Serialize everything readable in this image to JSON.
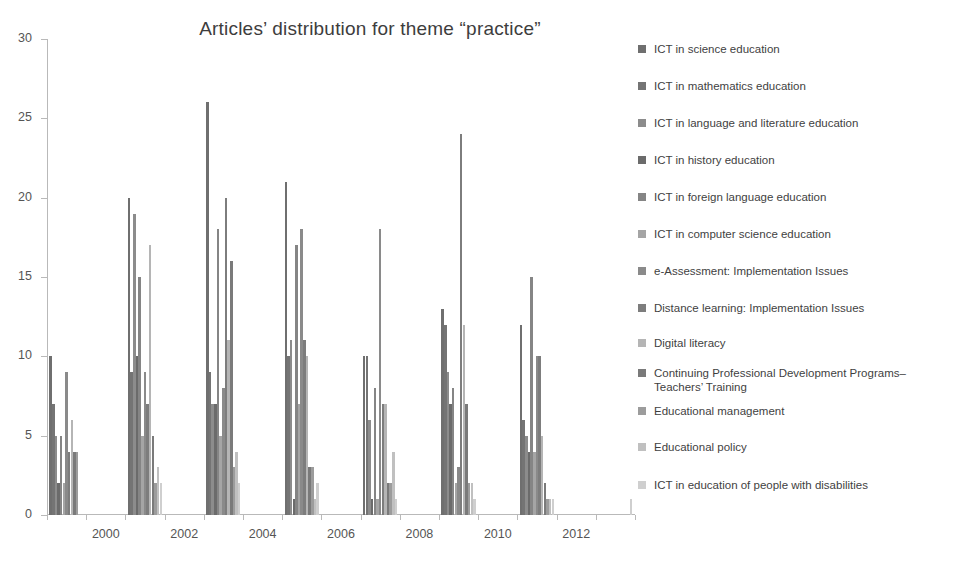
{
  "chart_data": {
    "type": "bar",
    "title": "Articles’ distribution for theme “practice”",
    "xlabel": "",
    "ylabel": "",
    "ylim": [
      0,
      30
    ],
    "ytick_values": [
      0,
      5,
      10,
      15,
      20,
      25,
      30
    ],
    "ytick_labels": [
      "0",
      "5",
      "10",
      "15",
      "20",
      "25",
      "30"
    ],
    "grid": false,
    "legend_position": "right",
    "categories": [
      "1999",
      "2000",
      "2001",
      "2002",
      "2003",
      "2004",
      "2005",
      "2006",
      "2007",
      "2008",
      "2009",
      "2010",
      "2011",
      "2012",
      "2013"
    ],
    "xtick_labels": [
      "2000",
      "2002",
      "2004",
      "2006",
      "2008",
      "2010",
      "2012"
    ],
    "series": [
      {
        "name": "ICT in science education",
        "color": "#6f6f6f",
        "values": [
          10,
          0,
          20,
          0,
          26,
          0,
          21,
          0,
          10,
          0,
          13,
          0,
          12,
          0,
          0
        ]
      },
      {
        "name": "ICT in mathematics education",
        "color": "#747474",
        "values": [
          7,
          0,
          9,
          0,
          9,
          0,
          10,
          0,
          10,
          0,
          12,
          0,
          6,
          0,
          0
        ]
      },
      {
        "name": "ICT in language and literature education",
        "color": "#8c8c8c",
        "values": [
          5,
          0,
          19,
          0,
          7,
          0,
          11,
          0,
          6,
          0,
          9,
          0,
          5,
          0,
          0
        ]
      },
      {
        "name": "ICT in history education",
        "color": "#6b6b6b",
        "values": [
          2,
          0,
          10,
          0,
          7,
          0,
          1,
          0,
          1,
          0,
          7,
          0,
          4,
          0,
          0
        ]
      },
      {
        "name": "ICT in foreign language education",
        "color": "#858585",
        "values": [
          5,
          0,
          15,
          0,
          18,
          0,
          17,
          0,
          8,
          0,
          8,
          0,
          15,
          0,
          0
        ]
      },
      {
        "name": "ICT in computer science education",
        "color": "#a5a5a5",
        "values": [
          2,
          0,
          5,
          0,
          5,
          0,
          7,
          0,
          1,
          0,
          2,
          0,
          4,
          0,
          0
        ]
      },
      {
        "name": "e-Assessment: Implementation Issues",
        "color": "#8a8a8a",
        "values": [
          9,
          0,
          9,
          0,
          8,
          0,
          18,
          0,
          18,
          0,
          3,
          0,
          10,
          0,
          0
        ]
      },
      {
        "name": "Distance learning: Implementation Issues",
        "color": "#7d7d7d",
        "values": [
          4,
          0,
          7,
          0,
          20,
          0,
          11,
          0,
          7,
          0,
          24,
          0,
          10,
          0,
          0
        ]
      },
      {
        "name": "Digital literacy",
        "color": "#b5b5b5",
        "values": [
          6,
          0,
          17,
          0,
          11,
          0,
          10,
          0,
          7,
          0,
          12,
          0,
          5,
          0,
          0
        ]
      },
      {
        "name": "Continuing Professional Development Programs–\nTeachers’ Training",
        "color": "#7a7a7a",
        "values": [
          4,
          0,
          5,
          0,
          16,
          0,
          3,
          0,
          2,
          0,
          7,
          0,
          2,
          0,
          0
        ]
      },
      {
        "name": "Educational management",
        "color": "#9c9c9c",
        "values": [
          4,
          0,
          2,
          0,
          3,
          0,
          3,
          0,
          2,
          0,
          2,
          0,
          1,
          0,
          0
        ]
      },
      {
        "name": "Educational policy",
        "color": "#c0c0c0",
        "values": [
          0,
          0,
          3,
          0,
          4,
          0,
          1,
          0,
          4,
          0,
          2,
          0,
          1,
          0,
          0
        ]
      },
      {
        "name": "ICT in education of people with disabilities",
        "color": "#cfcfcf",
        "values": [
          0,
          0,
          2,
          0,
          2,
          0,
          2,
          0,
          1,
          0,
          1,
          0,
          1,
          0,
          1
        ]
      }
    ]
  },
  "legend": {
    "items": [
      {
        "label": "ICT in science education",
        "color": "#6f6f6f"
      },
      {
        "label": "ICT in mathematics education",
        "color": "#747474"
      },
      {
        "label": "ICT in language and literature education",
        "color": "#8c8c8c"
      },
      {
        "label": "ICT in history education",
        "color": "#6b6b6b"
      },
      {
        "label": "ICT in foreign language education",
        "color": "#858585"
      },
      {
        "label": "ICT in computer science education",
        "color": "#a5a5a5"
      },
      {
        "label": "e-Assessment: Implementation Issues",
        "color": "#8a8a8a"
      },
      {
        "label": "Distance learning: Implementation Issues",
        "color": "#7d7d7d"
      },
      {
        "label": "Digital literacy",
        "color": "#b5b5b5"
      },
      {
        "label": "Continuing Professional Development Programs–\nTeachers’ Training",
        "color": "#7a7a7a"
      },
      {
        "label": "Educational management",
        "color": "#9c9c9c"
      },
      {
        "label": "Educational policy",
        "color": "#c0c0c0"
      },
      {
        "label": "ICT in education of people with disabilities",
        "color": "#cfcfcf"
      }
    ]
  },
  "axes": {
    "axis_color": "#b9b9b9",
    "tick_label_color": "#555555"
  }
}
